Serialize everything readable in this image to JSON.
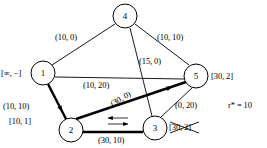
{
  "figure": {
    "type": "network-flow-graph",
    "annotation": "r* = 10",
    "background_color": "#ffffff",
    "line_color": "#000000"
  },
  "nodes": [
    {
      "id": "4",
      "label": "4",
      "cx": 125,
      "cy": 16,
      "r": 12,
      "node_label": "",
      "node_label_struck": false
    },
    {
      "id": "1",
      "label": "1",
      "cx": 43,
      "cy": 73,
      "r": 12,
      "node_label": "[∞, −]",
      "node_label_struck": false
    },
    {
      "id": "5",
      "label": "5",
      "cx": 196,
      "cy": 76,
      "r": 12,
      "node_label": "[30, 2]",
      "node_label_struck": false
    },
    {
      "id": "2",
      "label": "2",
      "cx": 71,
      "cy": 130,
      "r": 12,
      "node_label": "[10, 1]",
      "node_label_struck": false
    },
    {
      "id": "3",
      "label": "3",
      "cx": 155,
      "cy": 128,
      "r": 12,
      "node_label": "[30, 2]",
      "node_label_struck": true
    }
  ],
  "node_labels": {
    "n1": "[∞, −]",
    "n5": "[30, 2]",
    "n2": "[10, 1]",
    "n3_struck": "[30, 2]"
  },
  "edges": [
    {
      "id": "e14",
      "from": "1",
      "to": "4",
      "label": "(10, 0)",
      "thick": false,
      "arrow": "none"
    },
    {
      "id": "e45",
      "from": "4",
      "to": "5",
      "label": "(10, 10)",
      "thick": false,
      "arrow": "none"
    },
    {
      "id": "e43",
      "from": "4",
      "to": "3",
      "label": "(15, 0)",
      "thick": false,
      "arrow": "none"
    },
    {
      "id": "e15",
      "from": "1",
      "to": "5",
      "label": "(10, 20)",
      "thick": false,
      "arrow": "none"
    },
    {
      "id": "e25",
      "from": "2",
      "to": "5",
      "label": "(30, 0)",
      "thick": true,
      "arrow": "forward"
    },
    {
      "id": "e12",
      "from": "1",
      "to": "2",
      "label": "(10, 10)",
      "thick": true,
      "arrow": "forward"
    },
    {
      "id": "e35",
      "from": "3",
      "to": "5",
      "label": "(0, 20)",
      "thick": false,
      "arrow": "none"
    },
    {
      "id": "e23",
      "from": "2",
      "to": "3",
      "label": "(30, 10)",
      "thick": true,
      "arrow": "double"
    }
  ],
  "edge_labels": {
    "e14": "(10, 0)",
    "e45": "(10, 10)",
    "e43": "(15, 0)",
    "e15": "(10, 20)",
    "e25": "(30, 0)",
    "e12": "(10, 10)",
    "e35": "(0, 20)",
    "e23": "(30, 10)"
  }
}
